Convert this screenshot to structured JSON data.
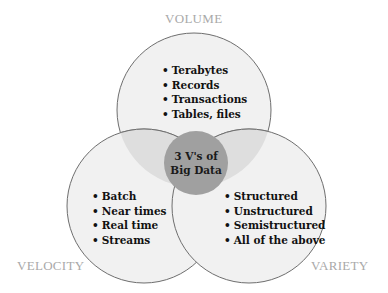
{
  "diagram": {
    "type": "venn",
    "center": {
      "line1": "3 V's of",
      "line2": "Big Data"
    },
    "sets": {
      "volume": {
        "label": "VOLUME",
        "items": [
          "Terabytes",
          "Records",
          "Transactions",
          "Tables, files"
        ]
      },
      "velocity": {
        "label": "VELOCITY",
        "items": [
          "Batch",
          "Near times",
          "Real time",
          "Streams"
        ]
      },
      "variety": {
        "label": "VARIETY",
        "items": [
          "Structured",
          "Unstructured",
          "Semistructured",
          "All of the above"
        ]
      }
    },
    "colors": {
      "circle_fill": "#f0f0f0",
      "circle_stroke": "#707070",
      "overlap_fill": "#dcdcdc",
      "center_fill": "#9e9e9e",
      "label_color": "#a9a9a9"
    }
  }
}
